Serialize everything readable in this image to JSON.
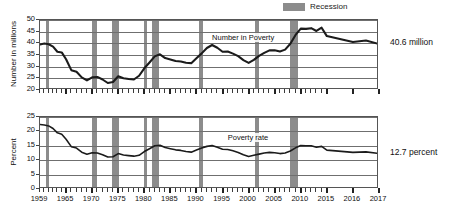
{
  "legend": {
    "swatch_name": "recession-swatch",
    "label": "Recession",
    "color": "#8c8c8c"
  },
  "callouts": {
    "number": "40.6 million",
    "percent": "12.7 percent"
  },
  "chart_data": [
    {
      "type": "line",
      "title": "",
      "id": "number-in-poverty",
      "ylabel": "Number in millions",
      "xlabel": "",
      "ylim": [
        20,
        50
      ],
      "yticks": [
        20,
        25,
        30,
        35,
        40,
        45,
        50
      ],
      "grid": true,
      "series_label": "Number in Poverty",
      "series_label_x": 1993,
      "series_label_y": 42.0,
      "end_annotation": "40.6 million",
      "x": [
        1959,
        1960,
        1961,
        1962,
        1963,
        1964,
        1965,
        1966,
        1967,
        1968,
        1969,
        1970,
        1971,
        1972,
        1973,
        1974,
        1975,
        1976,
        1977,
        1978,
        1979,
        1980,
        1981,
        1982,
        1983,
        1984,
        1985,
        1986,
        1987,
        1988,
        1989,
        1990,
        1991,
        1992,
        1993,
        1994,
        1995,
        1996,
        1997,
        1998,
        1999,
        2000,
        2001,
        2002,
        2003,
        2004,
        2005,
        2006,
        2007,
        2008,
        2009,
        2010,
        2011,
        2012,
        2013,
        2014,
        2015,
        2016,
        2016.5,
        2017
      ],
      "values": [
        39.5,
        39.9,
        39.6,
        38.6,
        36.4,
        36.1,
        33.2,
        28.5,
        27.8,
        25.4,
        24.1,
        25.4,
        25.6,
        24.5,
        23.0,
        23.4,
        25.9,
        25.0,
        24.7,
        24.5,
        26.1,
        29.3,
        31.8,
        34.4,
        35.3,
        33.7,
        33.1,
        32.4,
        32.2,
        31.7,
        31.5,
        33.6,
        35.7,
        38.0,
        39.3,
        38.1,
        36.4,
        36.5,
        35.6,
        34.5,
        32.8,
        31.6,
        32.9,
        34.6,
        35.9,
        37.0,
        37.0,
        36.5,
        37.3,
        39.8,
        43.6,
        46.3,
        46.2,
        46.5,
        45.3,
        46.7,
        43.1,
        40.6,
        41.2,
        39.7
      ]
    },
    {
      "type": "line",
      "title": "",
      "id": "poverty-rate",
      "ylabel": "Percent",
      "xlabel": "",
      "ylim": [
        0,
        25
      ],
      "yticks": [
        0,
        5,
        10,
        15,
        20,
        25
      ],
      "grid": true,
      "series_label": "Poverty rate",
      "series_label_x": 1996,
      "series_label_y": 17.4,
      "end_annotation": "12.7 percent",
      "x": [
        1959,
        1960,
        1961,
        1962,
        1963,
        1964,
        1965,
        1966,
        1967,
        1968,
        1969,
        1970,
        1971,
        1972,
        1973,
        1974,
        1975,
        1976,
        1977,
        1978,
        1979,
        1980,
        1981,
        1982,
        1983,
        1984,
        1985,
        1986,
        1987,
        1988,
        1989,
        1990,
        1991,
        1992,
        1993,
        1994,
        1995,
        1996,
        1997,
        1998,
        1999,
        2000,
        2001,
        2002,
        2003,
        2004,
        2005,
        2006,
        2007,
        2008,
        2009,
        2010,
        2011,
        2012,
        2013,
        2014,
        2015,
        2016,
        2016.5,
        2017
      ],
      "values": [
        22.4,
        22.2,
        21.9,
        21.0,
        19.5,
        19.0,
        17.3,
        14.7,
        14.2,
        12.8,
        12.1,
        12.6,
        12.5,
        11.9,
        11.1,
        11.2,
        12.3,
        11.8,
        11.6,
        11.4,
        11.7,
        13.0,
        14.0,
        15.0,
        15.2,
        14.4,
        14.0,
        13.6,
        13.4,
        13.0,
        12.8,
        13.5,
        14.2,
        14.8,
        15.1,
        14.5,
        13.8,
        13.7,
        13.3,
        12.7,
        11.9,
        11.3,
        11.7,
        12.1,
        12.5,
        12.7,
        12.6,
        12.3,
        12.5,
        13.2,
        14.3,
        15.1,
        15.0,
        15.0,
        14.5,
        14.8,
        13.5,
        12.7,
        12.9,
        12.3
      ]
    }
  ],
  "xaxis": {
    "labels": [
      "1959",
      "1965",
      "1970",
      "1975",
      "1980",
      "1985",
      "1990",
      "1995",
      "2000",
      "2005",
      "2010",
      "2015",
      "2016",
      "2017"
    ],
    "label_years": [
      1959,
      1965,
      1970,
      1975,
      1980,
      1985,
      1990,
      1995,
      2000,
      2005,
      2010,
      2015,
      2016,
      2017
    ]
  },
  "recessions": [
    {
      "start": 1960.3,
      "end": 1961.1
    },
    {
      "start": 1969.9,
      "end": 1970.9
    },
    {
      "start": 1973.9,
      "end": 1975.2
    },
    {
      "start": 1980.0,
      "end": 1980.6
    },
    {
      "start": 1981.5,
      "end": 1982.9
    },
    {
      "start": 1990.5,
      "end": 1991.2
    },
    {
      "start": 2001.2,
      "end": 2001.9
    },
    {
      "start": 2007.9,
      "end": 2009.5
    }
  ]
}
